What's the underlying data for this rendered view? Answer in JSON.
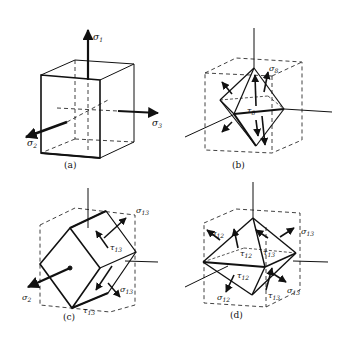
{
  "figure": {
    "panels": [
      {
        "id": "a",
        "caption": "(a)",
        "shape": "cube",
        "labels": [
          {
            "sym": "σ",
            "sub": "1"
          },
          {
            "sym": "σ",
            "sub": "2"
          },
          {
            "sym": "σ",
            "sub": "3"
          }
        ]
      },
      {
        "id": "b",
        "caption": "(b)",
        "shape": "octahedron-in-cube",
        "labels": [
          {
            "sym": "σ",
            "sub": "8"
          },
          {
            "sym": "τ",
            "sub": "8"
          }
        ]
      },
      {
        "id": "c",
        "caption": "(c)",
        "shape": "rotated-prism-in-cube",
        "labels": [
          {
            "sym": "σ",
            "sub": "13"
          },
          {
            "sym": "τ",
            "sub": "13"
          },
          {
            "sym": "σ",
            "sub": "2"
          },
          {
            "sym": "σ",
            "sub": "13"
          },
          {
            "sym": "τ",
            "sub": "13"
          }
        ]
      },
      {
        "id": "d",
        "caption": "(d)",
        "shape": "dodecahedron-in-cube",
        "labels": [
          {
            "sym": "σ",
            "sub": "12"
          },
          {
            "sym": "τ",
            "sub": "12"
          },
          {
            "sym": "τ",
            "sub": "13"
          },
          {
            "sym": "σ",
            "sub": "13"
          },
          {
            "sym": "τ",
            "sub": "12"
          },
          {
            "sym": "σ",
            "sub": "13"
          },
          {
            "sym": "σ",
            "sub": "12"
          },
          {
            "sym": "τ",
            "sub": "13"
          }
        ]
      }
    ]
  }
}
